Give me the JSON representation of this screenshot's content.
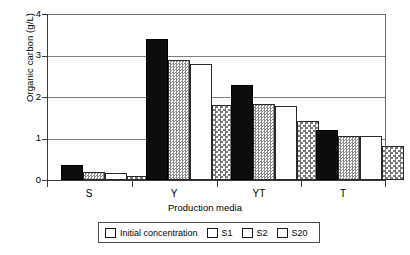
{
  "chart_data": {
    "type": "bar",
    "title": "",
    "xlabel": "Production media",
    "ylabel": "Organic carbon (g/L)",
    "categories": [
      "S",
      "Y",
      "YT",
      "T"
    ],
    "ylim": [
      0,
      4
    ],
    "yticks": [
      "0",
      "1",
      "2",
      "3",
      "4"
    ],
    "grid": true,
    "legend_position": "bottom",
    "series": [
      {
        "name": "Initial concentration",
        "pattern": "solid-black",
        "values": [
          0.37,
          3.4,
          2.3,
          1.2
        ]
      },
      {
        "name": "S1",
        "pattern": "fine-checker-gray",
        "values": [
          0.2,
          2.9,
          1.83,
          1.05
        ]
      },
      {
        "name": "S2",
        "pattern": "white",
        "values": [
          0.18,
          2.8,
          1.78,
          1.06
        ]
      },
      {
        "name": "S20",
        "pattern": "coarse-checker-gray",
        "values": [
          0.09,
          1.8,
          1.43,
          0.82
        ]
      }
    ]
  },
  "axis": {
    "y_tick_0": "0",
    "y_tick_1": "1",
    "y_tick_2": "2",
    "y_tick_3": "3",
    "y_tick_4": "4",
    "y_title": "Organic carbon (g/L)",
    "x_title": "Production media",
    "x_cat_0": "S",
    "x_cat_1": "Y",
    "x_cat_2": "YT",
    "x_cat_3": "T"
  },
  "legend": {
    "items": [
      {
        "label": "Initial concentration"
      },
      {
        "label": "S1"
      },
      {
        "label": "S2"
      },
      {
        "label": "S20"
      }
    ]
  },
  "colors": {
    "initial_concentration": "#0d0d0d",
    "s1": "#8d8d8d",
    "s2": "#ffffff",
    "s20": "#7a7a7a",
    "axis": "#3a3a3a",
    "grid": "#7d7d7d"
  }
}
